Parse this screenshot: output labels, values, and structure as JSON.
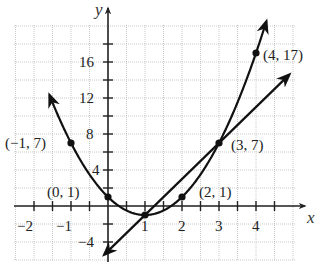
{
  "chart_data": {
    "type": "line",
    "title": "",
    "xlabel": "x",
    "ylabel": "y",
    "xlim": [
      -2.5,
      5.1
    ],
    "ylim": [
      -6,
      20
    ],
    "grid": true,
    "x_ticks": [
      -2,
      -1,
      1,
      2,
      3,
      4
    ],
    "x_tick_labels": [
      "−2",
      "−1",
      "1",
      "2",
      "3",
      "4"
    ],
    "y_ticks": [
      -4,
      4,
      8,
      12,
      16
    ],
    "y_tick_labels": [
      "−4",
      "4",
      "8",
      "12",
      "16"
    ],
    "series": [
      {
        "name": "parabola",
        "equation": "y = 2x^2 - 4x + 1",
        "x": [
          -1.6,
          -1,
          0,
          1,
          2,
          3,
          4,
          4.3
        ],
        "y": [
          13.5,
          7,
          1,
          -1,
          1,
          7,
          17,
          21
        ]
      },
      {
        "name": "line",
        "equation": "y = 4x - 5",
        "x": [
          -0.1,
          1,
          3,
          4.9
        ],
        "y": [
          -5.4,
          -1,
          7,
          14.6
        ]
      }
    ],
    "points": [
      {
        "x": -1,
        "y": 7,
        "label": "(−1, 7)"
      },
      {
        "x": 0,
        "y": 1,
        "label": "(0, 1)"
      },
      {
        "x": 1,
        "y": -1,
        "label": ""
      },
      {
        "x": 2,
        "y": 1,
        "label": "(2, 1)"
      },
      {
        "x": 3,
        "y": 7,
        "label": "(3, 7)"
      },
      {
        "x": 4,
        "y": 17,
        "label": "(4, 17)"
      }
    ]
  },
  "labels": {
    "x_axis": "x",
    "y_axis": "y",
    "p_m1_7": "(−1, 7)",
    "p_0_1": "(0, 1)",
    "p_2_1": "(2, 1)",
    "p_3_7": "(3, 7)",
    "p_4_17": "(4, 17)",
    "tx_m2": "−2",
    "tx_m1": "−1",
    "tx_1": "1",
    "tx_2": "2",
    "tx_3": "3",
    "tx_4": "4",
    "ty_16": "16",
    "ty_12": "12",
    "ty_8": "8",
    "ty_4": "4",
    "ty_m4": "−4"
  }
}
